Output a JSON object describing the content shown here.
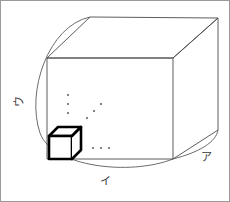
{
  "figure": {
    "type": "geometry-diagram",
    "canvas": {
      "width": 230,
      "height": 202,
      "background": "#ffffff"
    },
    "colors": {
      "outline": "#4a4a4a",
      "cube_outline": "#000000",
      "arc": "#5a5a5a",
      "dot": "#5a5a5a",
      "label_text": "#3a3a3a",
      "frame": "#9a9a9a"
    },
    "labels": [
      {
        "id": "label-u",
        "text": "ウ",
        "position": "left-edge",
        "rotated": true
      },
      {
        "id": "label-i",
        "text": "イ",
        "position": "bottom-edge",
        "rotated": false
      },
      {
        "id": "label-a",
        "text": "ア",
        "position": "right-edge",
        "rotated": false
      }
    ],
    "solid": {
      "front_face": {
        "x1": 47,
        "y1": 58,
        "x2": 173,
        "y2": 159
      },
      "depth_offset": {
        "dx": 45,
        "dy": -41
      },
      "back_top_left": {
        "x": 90,
        "y": 17
      },
      "back_top_right": {
        "x": 218,
        "y": 18
      },
      "back_bottom_right": {
        "x": 218,
        "y": 130
      }
    },
    "unit_cube": {
      "front": {
        "x1": 49,
        "y1": 135,
        "x2": 72,
        "y2": 158
      },
      "depth_offset": {
        "dx": 9,
        "dy": -9
      },
      "stroke_width": 2.6
    },
    "arcs": [
      {
        "id": "arc-left",
        "from": "back_top_left",
        "to": "front_bottom_right",
        "style": "elliptical-sweep"
      },
      {
        "id": "arc-right",
        "from": "front_bottom_right",
        "to": "back_bottom_right",
        "style": "elliptical-sweep"
      }
    ],
    "ellipses_marks": [
      {
        "id": "dots-vertical",
        "glyph": "⋮",
        "count": 3,
        "orientation": "vertical"
      },
      {
        "id": "dots-diagonal",
        "glyph": "⋰",
        "count": 3,
        "orientation": "diagonal-up"
      },
      {
        "id": "dots-horizontal",
        "glyph": "⋯",
        "count": 3,
        "orientation": "horizontal"
      }
    ]
  }
}
